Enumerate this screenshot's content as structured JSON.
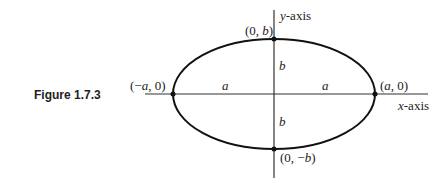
{
  "caption": "Figure 1.7.3",
  "labels": {
    "y_axis": "-axis",
    "y_axis_var": "y",
    "x_axis": "-axis",
    "x_axis_var": "x",
    "top_vertex": [
      "(0, ",
      "b",
      ")"
    ],
    "bottom_vertex": [
      "(0, −",
      "b",
      ")"
    ],
    "left_vertex": [
      "(−",
      "a",
      ", 0)"
    ],
    "right_vertex": [
      "(",
      "a",
      ", 0)"
    ],
    "semi_major_left": "a",
    "semi_major_right": "a",
    "semi_minor_top": "b",
    "semi_minor_bottom": "b"
  },
  "geometry": {
    "center": [
      274,
      94
    ],
    "rx": 101,
    "ry": 55
  }
}
